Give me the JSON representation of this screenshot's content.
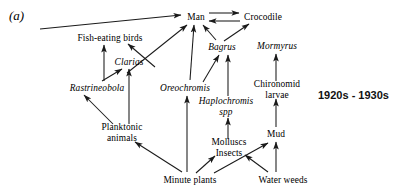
{
  "figure": {
    "panel_label": "(a)",
    "era_label": "1920s - 1930s"
  },
  "nodes": [
    {
      "id": "man",
      "label": "Man",
      "x": 196,
      "y": 17,
      "italic": false,
      "multiline": false
    },
    {
      "id": "crocodile",
      "label": "Crocodile",
      "x": 263,
      "y": 17,
      "italic": false,
      "multiline": false
    },
    {
      "id": "fish-eating-birds",
      "label": "Fish-eating birds",
      "x": 110,
      "y": 38,
      "italic": false,
      "multiline": false
    },
    {
      "id": "bagrus",
      "label": "Bagrus",
      "x": 222,
      "y": 47,
      "italic": true,
      "multiline": false
    },
    {
      "id": "mormyrus",
      "label": "Mormyrus",
      "x": 277,
      "y": 46,
      "italic": true,
      "multiline": false
    },
    {
      "id": "clarias",
      "label": "Clarias",
      "x": 129,
      "y": 62,
      "italic": true,
      "multiline": false
    },
    {
      "id": "rastrineobola",
      "label": "Rastrineobola",
      "x": 97,
      "y": 88,
      "italic": true,
      "multiline": false
    },
    {
      "id": "oreochromis",
      "label": "Oreochromis",
      "x": 185,
      "y": 88,
      "italic": true,
      "multiline": false
    },
    {
      "id": "chironomid-larvae",
      "label": "Chironomid larvae",
      "x": 277,
      "y": 90,
      "italic": false,
      "multiline": true
    },
    {
      "id": "haplochromis-spp",
      "label": "Haplochromis spp",
      "x": 226,
      "y": 107,
      "italic": true,
      "multiline": true
    },
    {
      "id": "planktonic-animals",
      "label": "Planktonic animals",
      "x": 122,
      "y": 133,
      "italic": false,
      "multiline": true
    },
    {
      "id": "mud",
      "label": "Mud",
      "x": 276,
      "y": 134,
      "italic": false,
      "multiline": false
    },
    {
      "id": "molluscs-insects",
      "label": "Molluscs Insects",
      "x": 229,
      "y": 148,
      "italic": false,
      "multiline": true
    },
    {
      "id": "minute-plants",
      "label": "Minute plants",
      "x": 190,
      "y": 180,
      "italic": false,
      "multiline": false
    },
    {
      "id": "water-weeds",
      "label": "Water weeds",
      "x": 283,
      "y": 180,
      "italic": false,
      "multiline": false
    }
  ],
  "edges": [
    {
      "id": "fish-eating-birds-to-man",
      "from": "fish-eating-birds",
      "to": "man",
      "x1": 40,
      "y1": 29,
      "x2": 181,
      "y2": 15
    },
    {
      "id": "man-to-crocodile",
      "from": "man",
      "to": "crocodile",
      "x1": 209,
      "y1": 13,
      "x2": 239,
      "y2": 13
    },
    {
      "id": "crocodile-to-man",
      "from": "crocodile",
      "to": "man",
      "x1": 240,
      "y1": 21,
      "x2": 209,
      "y2": 21
    },
    {
      "id": "clarias-to-man",
      "from": "clarias",
      "to": "man",
      "x1": 127,
      "y1": 73,
      "x2": 187,
      "y2": 25
    },
    {
      "id": "oreochromis-to-man",
      "from": "oreochromis",
      "to": "man",
      "x1": 190,
      "y1": 80,
      "x2": 194,
      "y2": 25
    },
    {
      "id": "bagrus-to-man",
      "from": "bagrus",
      "to": "man",
      "x1": 216,
      "y1": 40,
      "x2": 203,
      "y2": 25
    },
    {
      "id": "bagrus-to-crocodile",
      "from": "bagrus",
      "to": "crocodile",
      "x1": 224,
      "y1": 41,
      "x2": 249,
      "y2": 24
    },
    {
      "id": "clarias-to-fish-eating-birds",
      "from": "clarias",
      "to": "fish-eating-birds",
      "x1": 155,
      "y1": 67,
      "x2": 128,
      "y2": 44
    },
    {
      "id": "rastrineobola-to-fish-birds",
      "from": "rastrineobola",
      "to": "fish-eating-birds",
      "x1": 104,
      "y1": 81,
      "x2": 104,
      "y2": 45
    },
    {
      "id": "rastrineobola-to-clarias",
      "from": "rastrineobola",
      "to": "clarias",
      "x1": 102,
      "y1": 81,
      "x2": 122,
      "y2": 69
    },
    {
      "id": "planktonic-to-clarias",
      "from": "planktonic-animals",
      "to": "clarias",
      "x1": 129,
      "y1": 124,
      "x2": 129,
      "y2": 69
    },
    {
      "id": "planktonic-to-rastrineobola",
      "from": "planktonic-animals",
      "to": "rastrineobola",
      "x1": 113,
      "y1": 124,
      "x2": 84,
      "y2": 95
    },
    {
      "id": "minute-plants-to-planktonic",
      "from": "minute-plants",
      "to": "planktonic-animals",
      "x1": 182,
      "y1": 172,
      "x2": 135,
      "y2": 142
    },
    {
      "id": "minute-plants-to-oreochromis",
      "from": "minute-plants",
      "to": "oreochromis",
      "x1": 187,
      "y1": 172,
      "x2": 187,
      "y2": 96
    },
    {
      "id": "minute-plants-to-molluscs",
      "from": "minute-plants",
      "to": "molluscs-insects",
      "x1": 196,
      "y1": 173,
      "x2": 215,
      "y2": 156
    },
    {
      "id": "molluscs-to-haplochromis",
      "from": "molluscs-insects",
      "to": "haplochromis-spp",
      "x1": 228,
      "y1": 139,
      "x2": 228,
      "y2": 118
    },
    {
      "id": "haplochromis-to-bagrus",
      "from": "haplochromis-spp",
      "to": "bagrus",
      "x1": 228,
      "y1": 96,
      "x2": 228,
      "y2": 55
    },
    {
      "id": "oreochromis-to-bagrus",
      "from": "oreochromis",
      "to": "bagrus",
      "x1": 203,
      "y1": 82,
      "x2": 219,
      "y2": 55
    },
    {
      "id": "water-weeds-to-molluscs",
      "from": "water-weeds",
      "to": "molluscs-insects",
      "x1": 268,
      "y1": 172,
      "x2": 245,
      "y2": 155
    },
    {
      "id": "water-weeds-to-mud",
      "from": "water-weeds",
      "to": "mud",
      "x1": 276,
      "y1": 172,
      "x2": 276,
      "y2": 142
    },
    {
      "id": "minute-plants-to-mud",
      "from": "minute-plants",
      "to": "mud",
      "x1": 214,
      "y1": 173,
      "x2": 268,
      "y2": 143
    },
    {
      "id": "mud-to-chironomid",
      "from": "mud",
      "to": "chironomid-larvae",
      "x1": 276,
      "y1": 127,
      "x2": 276,
      "y2": 99
    },
    {
      "id": "chironomid-to-mormyrus",
      "from": "chironomid-larvae",
      "to": "mormyrus",
      "x1": 276,
      "y1": 81,
      "x2": 276,
      "y2": 54
    }
  ],
  "style": {
    "line_color": "#1a1a1a",
    "text_color": "#000000",
    "background": "#ffffff"
  }
}
